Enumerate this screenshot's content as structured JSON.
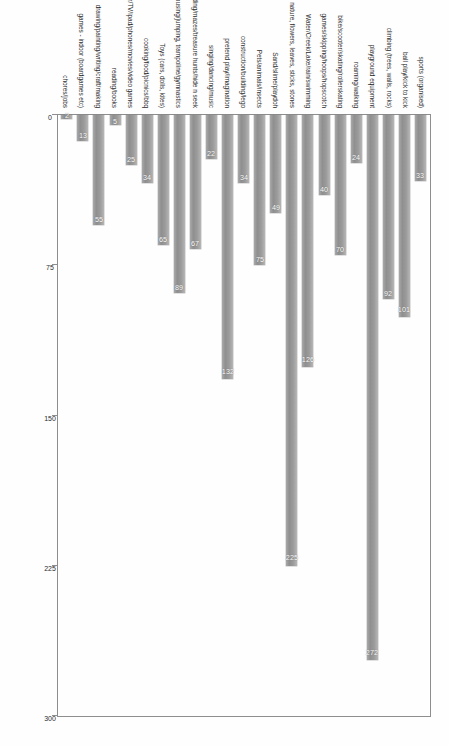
{
  "chart_data": {
    "type": "bar",
    "orientation": "vertical-rotated",
    "title": "",
    "subtitle": "",
    "xlabel": "",
    "ylabel": "",
    "ylim": [
      0,
      300
    ],
    "ticks": [
      "0",
      "75",
      "150",
      "225",
      "300"
    ],
    "tick_values": [
      0,
      75,
      150,
      225,
      300
    ],
    "grid": false,
    "legend": "none",
    "bar_color": "#9b9b9b",
    "label_color": "#ffffff",
    "categories": [
      "sports (organised)",
      "ball play/kick to kick",
      "climbing (trees, walls, rocks)",
      "playground equipment",
      "roaming/walking",
      "bike/scooter/skating/rollerskating",
      "games/skipping/hoops/hopscotch",
      "Water/Creek/Lake/rain/swimming",
      "nature, flowers, leaves, sticks, stones",
      "Sand/slime/playdoh",
      "Pets/animals/insects",
      "construction/building/lego",
      "pretend play/imagination",
      "singing/dancing/music",
      "cubbies/hiding/mazes/treasure hunts/hide n seek",
      "Running/chasey/rough housing/jumping, trampoline/gymnastics",
      "Toys (cars, dolls, kites)",
      "cooking/food/picnics/bbq",
      "computer/TV/ipad/phones/movies/video games",
      "reading/books",
      "drawing/painting/writing/craft/making",
      "games - indoor (boardgames etc)",
      "chores/jobs"
    ],
    "values": [
      33,
      101,
      92,
      272,
      24,
      70,
      40,
      126,
      225,
      49,
      75,
      34,
      132,
      22,
      67,
      89,
      65,
      34,
      25,
      5,
      55,
      13,
      2
    ],
    "value_labels": [
      "33",
      "101",
      "92",
      "272",
      "24",
      "70",
      "40",
      "126",
      "225",
      "49",
      "75",
      "34",
      "132",
      "22",
      "67",
      "89",
      "65",
      "34",
      "25",
      "5",
      "55",
      "13",
      "2"
    ]
  },
  "page": {
    "background": "#fefefe",
    "frame_color": "#8e8e8e"
  }
}
